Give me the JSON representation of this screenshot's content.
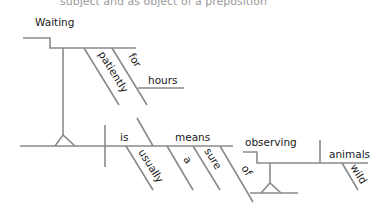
{
  "caption_fragment": "subject and as object of a preposition",
  "diagram": {
    "type": "sentence-diagram",
    "sentence": "Waiting patiently for hours is usually a sure means of observing wild animals",
    "line_color": "#8a8a8a",
    "text_color": "#1a1a1a",
    "words": {
      "gerund_subject": "Waiting",
      "modifier_patiently": "patiently",
      "preposition_for": "for",
      "object_hours": "hours",
      "verb": "is",
      "modifier_usually": "usually",
      "complement": "means",
      "article_a": "a",
      "modifier_sure": "sure",
      "preposition_of": "of",
      "gerund_object": "observing",
      "object_animals": "animals",
      "modifier_wild": "wild"
    }
  }
}
